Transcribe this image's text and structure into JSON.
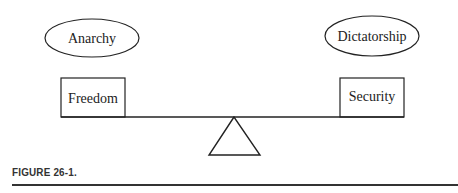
{
  "diagram": {
    "left_ellipse": "Anarchy",
    "right_ellipse": "Dictatorship",
    "left_box": "Freedom",
    "right_box": "Security"
  },
  "caption": "FIGURE 26-1."
}
